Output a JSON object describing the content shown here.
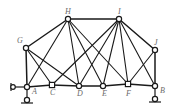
{
  "figure": {
    "name": "plane-truss-diagram",
    "type": "structural-truss-line-diagram",
    "width": 181,
    "height": 112,
    "background_color": "#ffffff",
    "member_color": "#1a1a1a",
    "joint_fill_color": "#ffffff",
    "joint_stroke_color": "#1a1a1a",
    "label_color": "#6b6b6b"
  },
  "joints": [
    {
      "id": "A",
      "label": "A",
      "x": 27,
      "y": 87,
      "shape": "circle",
      "label_dx": 5,
      "label_dy": 2
    },
    {
      "id": "B",
      "label": "B",
      "x": 155,
      "y": 86,
      "shape": "circle",
      "label_dx": 5,
      "label_dy": 2
    },
    {
      "id": "C",
      "label": "C",
      "x": 52,
      "y": 85,
      "shape": "square",
      "label_dx": -2,
      "label_dy": 4
    },
    {
      "id": "D",
      "label": "D",
      "x": 79,
      "y": 86,
      "shape": "circle",
      "label_dx": -2,
      "label_dy": 3
    },
    {
      "id": "E",
      "label": "E",
      "x": 103,
      "y": 86,
      "shape": "circle",
      "label_dx": -1,
      "label_dy": 3
    },
    {
      "id": "F",
      "label": "F",
      "x": 128,
      "y": 84,
      "shape": "square",
      "label_dx": -2,
      "label_dy": 5
    },
    {
      "id": "G",
      "label": "G",
      "x": 26,
      "y": 48,
      "shape": "circle",
      "label_dx": -9,
      "label_dy": -11
    },
    {
      "id": "H",
      "label": "H",
      "x": 68,
      "y": 19,
      "shape": "circle",
      "label_dx": -3,
      "label_dy": -11
    },
    {
      "id": "I",
      "label": "I",
      "x": 119,
      "y": 19,
      "shape": "circle",
      "label_dx": -1,
      "label_dy": -11
    },
    {
      "id": "J",
      "label": "J",
      "x": 155,
      "y": 50,
      "shape": "circle",
      "label_dx": -1,
      "label_dy": -11
    }
  ],
  "members": [
    {
      "from": "A",
      "to": "C"
    },
    {
      "from": "C",
      "to": "D"
    },
    {
      "from": "D",
      "to": "E"
    },
    {
      "from": "E",
      "to": "F"
    },
    {
      "from": "F",
      "to": "B"
    },
    {
      "from": "A",
      "to": "G"
    },
    {
      "from": "G",
      "to": "H"
    },
    {
      "from": "H",
      "to": "I"
    },
    {
      "from": "I",
      "to": "J"
    },
    {
      "from": "J",
      "to": "B"
    },
    {
      "from": "G",
      "to": "C"
    },
    {
      "from": "G",
      "to": "D"
    },
    {
      "from": "A",
      "to": "H"
    },
    {
      "from": "H",
      "to": "D"
    },
    {
      "from": "H",
      "to": "E"
    },
    {
      "from": "H",
      "to": "F"
    },
    {
      "from": "I",
      "to": "C"
    },
    {
      "from": "I",
      "to": "D"
    },
    {
      "from": "I",
      "to": "E"
    },
    {
      "from": "I",
      "to": "F"
    },
    {
      "from": "I",
      "to": "B"
    },
    {
      "from": "J",
      "to": "F"
    }
  ],
  "supports": [
    {
      "id": "support-A",
      "at_joint": "A",
      "type": "pin-roller-assembly",
      "description": "roller support below joint A with horizontal link to the left"
    },
    {
      "id": "support-B",
      "at_joint": "B",
      "type": "pin-support",
      "description": "pin support below joint B"
    }
  ],
  "labels": {
    "A": "A",
    "B": "B",
    "C": "C",
    "D": "D",
    "E": "E",
    "F": "F",
    "G": "G",
    "H": "H",
    "I": "I",
    "J": "J"
  }
}
